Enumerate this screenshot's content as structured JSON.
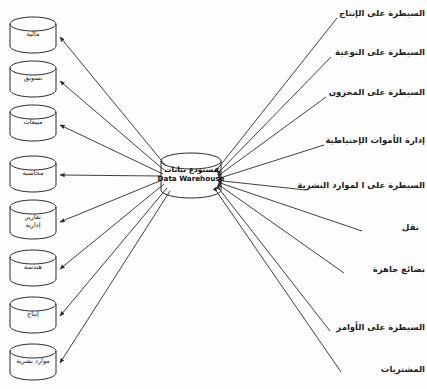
{
  "diagram": {
    "type": "data-warehouse-architecture",
    "title_node": {
      "arabic": "مستودع بيانات",
      "english": "Data Warehouse",
      "shape": "cylinder"
    },
    "sources": [
      {
        "id": "finance",
        "label": "مالية",
        "lines": [
          "مالية"
        ],
        "cx": 33,
        "cy": 35
      },
      {
        "id": "marketing",
        "label": "تسويق",
        "lines": [
          "تسويق"
        ],
        "cx": 33,
        "cy": 79
      },
      {
        "id": "sales",
        "label": "مبيعات",
        "lines": [
          "مبيعات"
        ],
        "cx": 33,
        "cy": 123
      },
      {
        "id": "accounting",
        "label": "محاسبة",
        "lines": [
          "محاسبة"
        ],
        "cx": 33,
        "cy": 174
      },
      {
        "id": "admin-reports",
        "label": "تقارير إدارية",
        "lines": [
          "تقارير",
          "إدارية"
        ],
        "cx": 33,
        "cy": 221
      },
      {
        "id": "engineering",
        "label": "هندسة",
        "lines": [
          "هندسة"
        ],
        "cx": 33,
        "cy": 268
      },
      {
        "id": "production",
        "label": "إنتاج",
        "lines": [
          "إنتاج"
        ],
        "cx": 33,
        "cy": 315
      },
      {
        "id": "hr",
        "label": "موارد بشرية",
        "lines": [
          "موارد بشرية"
        ],
        "cx": 33,
        "cy": 362
      }
    ],
    "outputs": [
      {
        "id": "production-control",
        "label": "السيطرة على الإنتاج",
        "x": 425,
        "y": 14
      },
      {
        "id": "quality-control",
        "label": "السيطرة على النوعية",
        "x": 425,
        "y": 53
      },
      {
        "id": "inventory-control",
        "label": "السيطرة على المخزون",
        "x": 425,
        "y": 93
      },
      {
        "id": "spare-parts-mgmt",
        "label": "إدارة الأموات الإحتياطية",
        "x": 425,
        "y": 141
      },
      {
        "id": "hr-control",
        "label": "السيطرة على ا لموارد البشرية",
        "x": 425,
        "y": 186
      },
      {
        "id": "transport",
        "label": "نقل",
        "x": 425,
        "y": 228,
        "spaced": true
      },
      {
        "id": "finished-goods",
        "label": "بضائع جاهزة",
        "x": 425,
        "y": 270
      },
      {
        "id": "order-control",
        "label": "السيطرة على الأوامر",
        "x": 425,
        "y": 328
      },
      {
        "id": "purchasing",
        "label": "المشتريات",
        "x": 425,
        "y": 370
      }
    ],
    "colors": {
      "stroke": "#2b2b2b",
      "background": "#fdfdfd",
      "text": "#1d1d1d"
    }
  }
}
